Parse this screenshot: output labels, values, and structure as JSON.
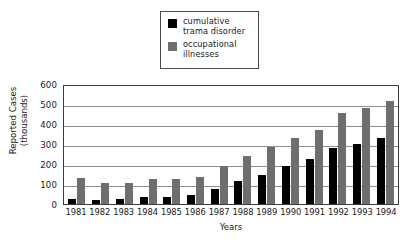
{
  "legend": {
    "position": "top-center",
    "entries": [
      {
        "label": "cumulative\ntrama disorder",
        "color": "#000000",
        "swatch": "black-square-icon"
      },
      {
        "label": "occupational\nillnesses",
        "color": "#6e6e6e",
        "swatch": "gray-square-icon"
      }
    ]
  },
  "axes": {
    "ylabel": "Reported Cases\n(thousands)",
    "xlabel": "Years",
    "yticks": [
      "0",
      "100",
      "200",
      "300",
      "400",
      "500",
      "600"
    ]
  },
  "chart_data": {
    "type": "bar",
    "title": "",
    "xlabel": "Years",
    "ylabel": "Reported Cases (thousands)",
    "ylim": [
      0,
      600
    ],
    "ytick_step": 100,
    "grid": true,
    "legend_position": "top-center",
    "categories": [
      "1981",
      "1982",
      "1983",
      "1984",
      "1985",
      "1986",
      "1987",
      "1988",
      "1989",
      "1990",
      "1991",
      "1992",
      "1993",
      "1994"
    ],
    "series": [
      {
        "name": "cumulative trama disorder",
        "color": "#000000",
        "values": [
          23,
          22,
          25,
          33,
          35,
          45,
          73,
          115,
          147,
          190,
          225,
          282,
          302,
          332
        ]
      },
      {
        "name": "occupational illnesses",
        "color": "#6e6e6e",
        "values": [
          128,
          105,
          106,
          123,
          125,
          136,
          190,
          240,
          285,
          330,
          370,
          457,
          482,
          515
        ]
      }
    ]
  }
}
